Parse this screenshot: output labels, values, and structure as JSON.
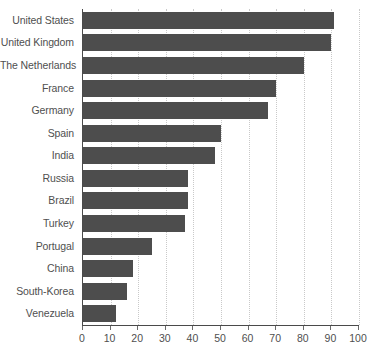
{
  "chart_data": {
    "type": "bar",
    "orientation": "horizontal",
    "title": "",
    "subtitle": "",
    "xlabel": "",
    "ylabel": "",
    "xlim": [
      0,
      100
    ],
    "xticks": [
      0,
      10,
      20,
      30,
      40,
      50,
      60,
      70,
      80,
      90,
      100
    ],
    "xtick_labels": [
      "0",
      "10",
      "20",
      "30",
      "40",
      "50",
      "60",
      "70",
      "80",
      "90",
      "100"
    ],
    "grid": "vertical-dotted",
    "legend": "none",
    "annotations": [],
    "categories": [
      "United States",
      "United Kingdom",
      "The Netherlands",
      "France",
      "Germany",
      "Spain",
      "India",
      "Russia",
      "Brazil",
      "Turkey",
      "Portugal",
      "China",
      "South-Korea",
      "Venezuela"
    ],
    "values": [
      91,
      90,
      80,
      70,
      67,
      50,
      48,
      38,
      38,
      37,
      25,
      18,
      16,
      12
    ],
    "series": [
      {
        "name": "value",
        "values": [
          91,
          90,
          80,
          70,
          67,
          50,
          48,
          38,
          38,
          37,
          25,
          18,
          16,
          12
        ]
      }
    ]
  },
  "style": {
    "bar_color": "#4d4d4d",
    "grid_color": "#c9c9c9",
    "axis_color": "#4a4a4a",
    "text_color": "#4f4f4f",
    "background": "#ffffff"
  }
}
